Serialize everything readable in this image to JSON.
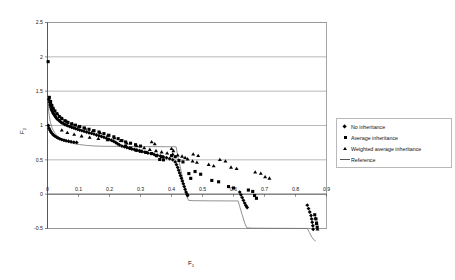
{
  "chart_data": {
    "type": "scatter",
    "title": "",
    "xlabel": "F",
    "xlabel_sub": "1",
    "ylabel": "F",
    "ylabel_sub": "2",
    "xlim": [
      0,
      0.9
    ],
    "ylim": [
      -0.5,
      2.5
    ],
    "xticks": [
      "0",
      "0.1",
      "0.2",
      "0.3",
      "0.4",
      "0.5",
      "0.6",
      "0.7",
      "0.8",
      "0.9"
    ],
    "xtick_values": [
      0,
      0.1,
      0.2,
      0.3,
      0.4,
      0.5,
      0.6,
      0.7,
      0.8,
      0.9
    ],
    "yticks": [
      "-0.5",
      "0",
      "0.5",
      "1",
      "1.5",
      "2",
      "2.5"
    ],
    "ytick_values": [
      -0.5,
      0,
      0.5,
      1,
      1.5,
      2,
      2.5
    ],
    "grid": "horizontal",
    "grid_color": "#9a9a9a",
    "plot_border_color": "#8f8f8f",
    "legend_position": "right",
    "legend": [
      {
        "label": "No inheritance",
        "marker": "diamond",
        "color": "#000000"
      },
      {
        "label": "Average inheritance",
        "marker": "square",
        "color": "#000000"
      },
      {
        "label": "Weighted average inheritance",
        "marker": "triangle",
        "color": "#000000"
      },
      {
        "label": "Reference",
        "marker": "line",
        "color": "#555555"
      }
    ],
    "series": [
      {
        "name": "No inheritance",
        "marker": "diamond",
        "color": "#000000",
        "points": [
          [
            0.004,
            1.38
          ],
          [
            0.006,
            1.34
          ],
          [
            0.008,
            1.3
          ],
          [
            0.01,
            1.27
          ],
          [
            0.012,
            1.24
          ],
          [
            0.014,
            1.22
          ],
          [
            0.016,
            1.2
          ],
          [
            0.018,
            1.18
          ],
          [
            0.021,
            1.16
          ],
          [
            0.024,
            1.14
          ],
          [
            0.027,
            1.12
          ],
          [
            0.03,
            1.1
          ],
          [
            0.034,
            1.085
          ],
          [
            0.038,
            1.07
          ],
          [
            0.042,
            1.055
          ],
          [
            0.046,
            1.04
          ],
          [
            0.051,
            1.03
          ],
          [
            0.056,
            1.015
          ],
          [
            0.061,
            1.005
          ],
          [
            0.066,
            0.995
          ],
          [
            0.072,
            0.985
          ],
          [
            0.078,
            0.975
          ],
          [
            0.084,
            0.965
          ],
          [
            0.09,
            0.955
          ],
          [
            0.097,
            0.945
          ],
          [
            0.104,
            0.935
          ],
          [
            0.111,
            0.925
          ],
          [
            0.118,
            0.915
          ],
          [
            0.126,
            0.905
          ],
          [
            0.134,
            0.895
          ],
          [
            0.142,
            0.885
          ],
          [
            0.15,
            0.875
          ],
          [
            0.158,
            0.862
          ],
          [
            0.166,
            0.85
          ],
          [
            0.174,
            0.84
          ],
          [
            0.182,
            0.828
          ],
          [
            0.19,
            0.815
          ],
          [
            0.198,
            0.8
          ],
          [
            0.206,
            0.785
          ],
          [
            0.213,
            0.77
          ],
          [
            0.22,
            0.752
          ],
          [
            0.226,
            0.735
          ],
          [
            0.232,
            0.718
          ],
          [
            0.003,
            1.0
          ],
          [
            0.005,
            0.96
          ],
          [
            0.008,
            0.93
          ],
          [
            0.011,
            0.905
          ],
          [
            0.015,
            0.882
          ],
          [
            0.019,
            0.862
          ],
          [
            0.024,
            0.845
          ],
          [
            0.029,
            0.83
          ],
          [
            0.034,
            0.817
          ],
          [
            0.04,
            0.805
          ],
          [
            0.046,
            0.795
          ],
          [
            0.053,
            0.786
          ],
          [
            0.06,
            0.778
          ],
          [
            0.068,
            0.77
          ],
          [
            0.076,
            0.763
          ],
          [
            0.085,
            0.757
          ],
          [
            0.094,
            0.752
          ],
          [
            0.24,
            0.7
          ],
          [
            0.248,
            0.69
          ],
          [
            0.256,
            0.678
          ],
          [
            0.264,
            0.668
          ],
          [
            0.272,
            0.658
          ],
          [
            0.28,
            0.65
          ],
          [
            0.288,
            0.64
          ],
          [
            0.296,
            0.632
          ],
          [
            0.305,
            0.622
          ],
          [
            0.314,
            0.612
          ],
          [
            0.324,
            0.6
          ],
          [
            0.334,
            0.59
          ],
          [
            0.344,
            0.578
          ],
          [
            0.354,
            0.566
          ],
          [
            0.364,
            0.555
          ],
          [
            0.374,
            0.543
          ],
          [
            0.384,
            0.53
          ],
          [
            0.394,
            0.515
          ],
          [
            0.404,
            0.5
          ],
          [
            0.412,
            0.47
          ],
          [
            0.416,
            0.43
          ],
          [
            0.42,
            0.39
          ],
          [
            0.423,
            0.35
          ],
          [
            0.426,
            0.31
          ],
          [
            0.429,
            0.27
          ],
          [
            0.432,
            0.23
          ],
          [
            0.435,
            0.19
          ],
          [
            0.438,
            0.15
          ],
          [
            0.441,
            0.11
          ],
          [
            0.444,
            0.07
          ],
          [
            0.447,
            0.03
          ],
          [
            0.45,
            0.0
          ],
          [
            0.452,
            -0.02
          ],
          [
            0.62,
            0.03
          ],
          [
            0.624,
            -0.01
          ],
          [
            0.628,
            -0.05
          ],
          [
            0.632,
            -0.09
          ],
          [
            0.636,
            -0.13
          ],
          [
            0.64,
            -0.165
          ],
          [
            0.644,
            -0.195
          ],
          [
            0.838,
            -0.16
          ],
          [
            0.842,
            -0.21
          ],
          [
            0.846,
            -0.26
          ],
          [
            0.85,
            -0.31
          ],
          [
            0.852,
            -0.36
          ],
          [
            0.854,
            -0.41
          ],
          [
            0.856,
            -0.46
          ],
          [
            0.857,
            -0.51
          ],
          [
            0.858,
            -0.56
          ],
          [
            0.859,
            -0.6
          ],
          [
            0.86,
            -0.63
          ],
          [
            0.861,
            -0.655
          ]
        ]
      },
      {
        "name": "Average inheritance",
        "marker": "square",
        "color": "#000000",
        "points": [
          [
            0.002,
            1.93
          ],
          [
            0.006,
            1.41
          ],
          [
            0.01,
            1.35
          ],
          [
            0.014,
            1.29
          ],
          [
            0.018,
            1.25
          ],
          [
            0.024,
            1.21
          ],
          [
            0.03,
            1.17
          ],
          [
            0.038,
            1.13
          ],
          [
            0.046,
            1.1
          ],
          [
            0.056,
            1.07
          ],
          [
            0.066,
            1.045
          ],
          [
            0.078,
            1.025
          ],
          [
            0.09,
            1.005
          ],
          [
            0.104,
            0.985
          ],
          [
            0.118,
            0.965
          ],
          [
            0.134,
            0.945
          ],
          [
            0.15,
            0.925
          ],
          [
            0.166,
            0.905
          ],
          [
            0.182,
            0.882
          ],
          [
            0.198,
            0.858
          ],
          [
            0.214,
            0.835
          ],
          [
            0.228,
            0.808
          ],
          [
            0.24,
            0.78
          ],
          [
            0.252,
            0.76
          ],
          [
            0.268,
            0.742
          ],
          [
            0.284,
            0.72
          ],
          [
            0.3,
            0.7
          ],
          [
            0.252,
            0.7
          ],
          [
            0.268,
            0.67
          ],
          [
            0.286,
            0.64
          ],
          [
            0.3,
            0.625
          ],
          [
            0.318,
            0.608
          ],
          [
            0.336,
            0.592
          ],
          [
            0.352,
            0.56
          ],
          [
            0.368,
            0.545
          ],
          [
            0.4,
            0.56
          ],
          [
            0.412,
            0.545
          ],
          [
            0.362,
            0.505
          ],
          [
            0.374,
            0.5
          ],
          [
            0.424,
            0.49
          ],
          [
            0.437,
            0.47
          ],
          [
            0.456,
            0.3
          ],
          [
            0.462,
            0.23
          ],
          [
            0.476,
            0.33
          ],
          [
            0.494,
            0.29
          ],
          [
            0.53,
            0.2
          ],
          [
            0.552,
            0.18
          ],
          [
            0.584,
            0.11
          ],
          [
            0.6,
            0.09
          ],
          [
            0.648,
            0.06
          ],
          [
            0.662,
            0.04
          ],
          [
            0.668,
            -0.02
          ],
          [
            0.674,
            -0.06
          ],
          [
            0.862,
            -0.3
          ],
          [
            0.866,
            -0.36
          ],
          [
            0.868,
            -0.42
          ],
          [
            0.87,
            -0.48
          ],
          [
            0.872,
            -0.54
          ],
          [
            0.873,
            -0.6
          ],
          [
            0.874,
            -0.64
          ]
        ]
      },
      {
        "name": "Weighted average inheritance",
        "marker": "triangle",
        "color": "#000000",
        "points": [
          [
            0.01,
            1.33
          ],
          [
            0.02,
            1.24
          ],
          [
            0.032,
            1.17
          ],
          [
            0.046,
            1.11
          ],
          [
            0.062,
            1.06
          ],
          [
            0.08,
            1.02
          ],
          [
            0.1,
            0.985
          ],
          [
            0.122,
            0.955
          ],
          [
            0.146,
            0.92
          ],
          [
            0.17,
            0.89
          ],
          [
            0.194,
            0.855
          ],
          [
            0.216,
            0.818
          ],
          [
            0.236,
            0.778
          ],
          [
            0.256,
            0.742
          ],
          [
            0.046,
            0.93
          ],
          [
            0.064,
            0.895
          ],
          [
            0.086,
            0.868
          ],
          [
            0.11,
            0.845
          ],
          [
            0.136,
            0.826
          ],
          [
            0.164,
            0.806
          ],
          [
            0.194,
            0.788
          ],
          [
            0.288,
            0.7
          ],
          [
            0.312,
            0.672
          ],
          [
            0.33,
            0.648
          ],
          [
            0.336,
            0.76
          ],
          [
            0.346,
            0.73
          ],
          [
            0.35,
            0.63
          ],
          [
            0.368,
            0.612
          ],
          [
            0.386,
            0.596
          ],
          [
            0.4,
            0.66
          ],
          [
            0.406,
            0.63
          ],
          [
            0.404,
            0.58
          ],
          [
            0.42,
            0.565
          ],
          [
            0.434,
            0.55
          ],
          [
            0.444,
            0.53
          ],
          [
            0.452,
            0.51
          ],
          [
            0.47,
            0.58
          ],
          [
            0.486,
            0.56
          ],
          [
            0.468,
            0.48
          ],
          [
            0.482,
            0.46
          ],
          [
            0.52,
            0.43
          ],
          [
            0.536,
            0.41
          ],
          [
            0.556,
            0.5
          ],
          [
            0.574,
            0.48
          ],
          [
            0.592,
            0.39
          ],
          [
            0.61,
            0.37
          ],
          [
            0.67,
            0.32
          ],
          [
            0.688,
            0.3
          ],
          [
            0.702,
            0.25
          ],
          [
            0.716,
            0.23
          ],
          [
            0.864,
            -0.35
          ],
          [
            0.868,
            -0.43
          ],
          [
            0.871,
            -0.51
          ],
          [
            0.873,
            -0.58
          ]
        ]
      }
    ],
    "reference_line": {
      "name": "Reference",
      "color": "#6e6e6e",
      "points": [
        [
          0.0,
          1.4
        ],
        [
          0.004,
          1.2
        ],
        [
          0.009,
          1.05
        ],
        [
          0.016,
          0.95
        ],
        [
          0.025,
          0.88
        ],
        [
          0.036,
          0.828
        ],
        [
          0.05,
          0.79
        ],
        [
          0.066,
          0.76
        ],
        [
          0.084,
          0.738
        ],
        [
          0.104,
          0.722
        ],
        [
          0.126,
          0.71
        ],
        [
          0.15,
          0.702
        ],
        [
          0.176,
          0.698
        ],
        [
          0.204,
          0.696
        ],
        [
          0.234,
          0.695
        ],
        [
          0.266,
          0.694
        ],
        [
          0.3,
          0.693
        ],
        [
          0.34,
          0.692
        ],
        [
          0.38,
          0.691
        ],
        [
          0.415,
          0.69
        ],
        [
          0.42,
          0.56
        ],
        [
          0.428,
          0.4
        ],
        [
          0.436,
          0.23
        ],
        [
          0.444,
          0.07
        ],
        [
          0.45,
          -0.04
        ],
        [
          0.455,
          -0.09
        ],
        [
          0.47,
          -0.095
        ],
        [
          0.52,
          -0.097
        ],
        [
          0.57,
          -0.098
        ],
        [
          0.615,
          -0.099
        ],
        [
          0.62,
          -0.18
        ],
        [
          0.628,
          -0.3
        ],
        [
          0.636,
          -0.42
        ],
        [
          0.643,
          -0.49
        ],
        [
          0.66,
          -0.495
        ],
        [
          0.72,
          -0.497
        ],
        [
          0.79,
          -0.498
        ],
        [
          0.838,
          -0.499
        ],
        [
          0.845,
          -0.56
        ],
        [
          0.852,
          -0.62
        ],
        [
          0.858,
          -0.66
        ],
        [
          0.864,
          -0.68
        ]
      ]
    }
  }
}
